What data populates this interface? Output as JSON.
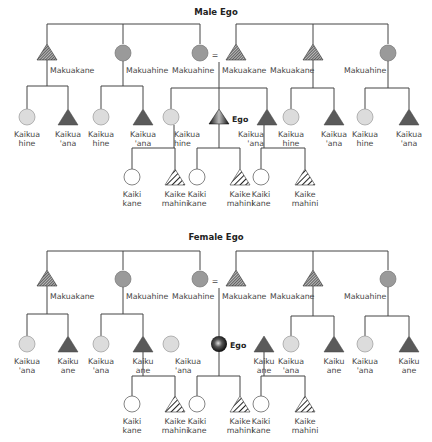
{
  "diagrams": [
    {
      "title": "Male Ego",
      "parents_generation": [
        {
          "label": "Makuakane",
          "shape": "triangle-hatched"
        },
        {
          "label": "Makuahine",
          "shape": "circle-gray"
        },
        {
          "label": "Makuahine",
          "shape": "circle-gray"
        },
        {
          "label": "=",
          "shape": "marriage"
        },
        {
          "label": "Makuakane",
          "shape": "triangle-hatched"
        },
        {
          "label": "Makuakane",
          "shape": "triangle-hatched"
        },
        {
          "label": "Makuahine",
          "shape": "circle-gray"
        }
      ],
      "ego_generation": [
        {
          "label1": "Kaikua",
          "label2": "hine",
          "shape": "circle-light"
        },
        {
          "label1": "Kaikua",
          "label2": "'ana",
          "shape": "triangle-dark"
        },
        {
          "label1": "Kaikua",
          "label2": "hine",
          "shape": "circle-light"
        },
        {
          "label1": "Kaikua",
          "label2": "'ana",
          "shape": "triangle-dark"
        },
        {
          "label1": "Kaikua",
          "label2": "hine",
          "shape": "circle-light"
        },
        {
          "label1": "Ego",
          "label2": "",
          "shape": "ego-triangle"
        },
        {
          "label1": "Kaikua",
          "label2": "'ana",
          "shape": "triangle-dark"
        },
        {
          "label1": "Kaikua",
          "label2": "hine",
          "shape": "circle-light"
        },
        {
          "label1": "Kaikua",
          "label2": "'ana",
          "shape": "triangle-dark"
        },
        {
          "label1": "Kaikua",
          "label2": "hine",
          "shape": "circle-light"
        },
        {
          "label1": "Kaikua",
          "label2": "'ana",
          "shape": "triangle-dark"
        }
      ],
      "children_generation": [
        {
          "label1": "Kaiki",
          "label2": "kane",
          "shape": "circle-white"
        },
        {
          "label1": "Kaike",
          "label2": "mahini",
          "shape": "triangle-striped"
        },
        {
          "label1": "Kaiki",
          "label2": "kane",
          "shape": "circle-white"
        },
        {
          "label1": "Kaike",
          "label2": "mahini",
          "shape": "triangle-striped"
        },
        {
          "label1": "Kaiki",
          "label2": "kane",
          "shape": "circle-white"
        },
        {
          "label1": "Kaike",
          "label2": "mahini",
          "shape": "triangle-striped"
        }
      ]
    },
    {
      "title": "Female Ego",
      "parents_generation": [
        {
          "label": "Makuakane",
          "shape": "triangle-hatched"
        },
        {
          "label": "Makuahine",
          "shape": "circle-gray"
        },
        {
          "label": "Makuahine",
          "shape": "circle-gray"
        },
        {
          "label": "=",
          "shape": "marriage"
        },
        {
          "label": "Makuakane",
          "shape": "triangle-hatched"
        },
        {
          "label": "Makuakane",
          "shape": "triangle-hatched"
        },
        {
          "label": "Makuahine",
          "shape": "circle-gray"
        }
      ],
      "ego_generation": [
        {
          "label1": "Kaikua",
          "label2": "'ana",
          "shape": "circle-light"
        },
        {
          "label1": "Kaiku",
          "label2": "ane",
          "shape": "triangle-dark"
        },
        {
          "label1": "Kaikua",
          "label2": "'ana",
          "shape": "circle-light"
        },
        {
          "label1": "Kaiku",
          "label2": "ane",
          "shape": "triangle-dark"
        },
        {
          "label1": "Kaikua",
          "label2": "'ana",
          "shape": "circle-light"
        },
        {
          "label1": "Ego",
          "label2": "",
          "shape": "ego-sphere"
        },
        {
          "label1": "Kaiku",
          "label2": "ane",
          "shape": "triangle-dark"
        },
        {
          "label1": "Kaikua",
          "label2": "'ana",
          "shape": "circle-light"
        },
        {
          "label1": "Kaiku",
          "label2": "ane",
          "shape": "triangle-dark"
        },
        {
          "label1": "Kaikua",
          "label2": "'ana",
          "shape": "circle-light"
        },
        {
          "label1": "Kaiku",
          "label2": "ane",
          "shape": "triangle-dark"
        }
      ],
      "children_generation": [
        {
          "label1": "Kaiki",
          "label2": "kane",
          "shape": "circle-white"
        },
        {
          "label1": "Kaike",
          "label2": "mahini",
          "shape": "triangle-striped"
        },
        {
          "label1": "Kaiki",
          "label2": "kane",
          "shape": "circle-white"
        },
        {
          "label1": "Kaike",
          "label2": "mahini",
          "shape": "triangle-striped"
        },
        {
          "label1": "Kaiki",
          "label2": "kane",
          "shape": "circle-white"
        },
        {
          "label1": "Kaike",
          "label2": "mahini",
          "shape": "triangle-striped"
        }
      ]
    }
  ],
  "colors": {
    "line": "#444444",
    "circle_gray": "#9a9a9a",
    "circle_light": "#dcdcdc",
    "triangle_dark": "#5a5a5a",
    "text": "#444444"
  }
}
